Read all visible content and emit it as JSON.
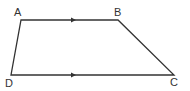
{
  "diagram": {
    "type": "trapezium",
    "stroke_color": "#333333",
    "background": "#ffffff",
    "vertices": {
      "A": {
        "label": "A",
        "x": 21,
        "y": 20
      },
      "B": {
        "label": "B",
        "x": 118,
        "y": 20
      },
      "C": {
        "label": "C",
        "x": 174,
        "y": 75
      },
      "D": {
        "label": "D",
        "x": 11,
        "y": 75
      }
    },
    "edges": [
      {
        "from": "A",
        "to": "B",
        "parallel_mark": true
      },
      {
        "from": "B",
        "to": "C",
        "parallel_mark": false
      },
      {
        "from": "C",
        "to": "D",
        "parallel_mark": true
      },
      {
        "from": "D",
        "to": "A",
        "parallel_mark": false
      }
    ]
  }
}
